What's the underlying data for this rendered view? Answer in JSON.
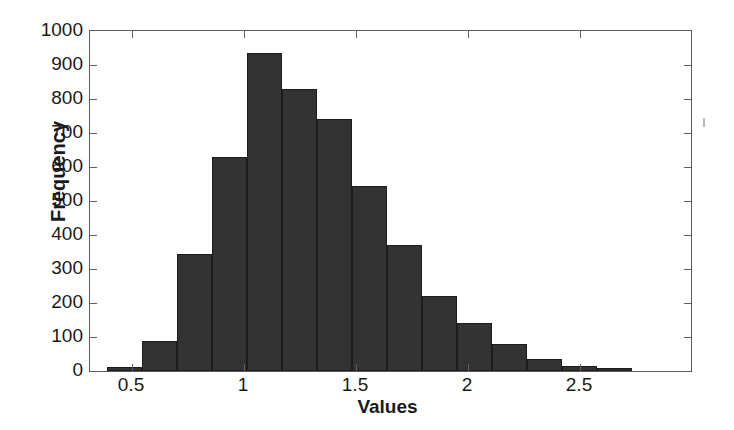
{
  "chart_data": {
    "type": "bar",
    "title": "",
    "subtitle": "",
    "xlabel": "Values",
    "ylabel": "Frequency",
    "xlim": [
      0.3125,
      2.9955
    ],
    "ylim": [
      0,
      1000
    ],
    "grid": false,
    "legend": null,
    "bin_width": 0.15625,
    "bar_color": "#333333",
    "bar_edge_color": "#1c1c1c",
    "axis_color": "#5d5d5d",
    "x_ticks": [
      0.5,
      1,
      1.5,
      2,
      2.5
    ],
    "x_tick_labels": [
      "0.5",
      "1",
      "1.5",
      "2",
      "2.5"
    ],
    "y_ticks": [
      0,
      100,
      200,
      300,
      400,
      500,
      600,
      700,
      800,
      900,
      1000
    ],
    "y_tick_labels": [
      "0",
      "100",
      "200",
      "300",
      "400",
      "500",
      "600",
      "700",
      "800",
      "900",
      "1000"
    ],
    "bin_edges": [
      0.3875,
      0.5438,
      0.7,
      0.8563,
      1.0125,
      1.1688,
      1.325,
      1.4813,
      1.6375,
      1.7938,
      1.95,
      2.1063,
      2.2625,
      2.4188,
      2.575,
      2.7313
    ],
    "bin_centers": [
      0.4656,
      0.6219,
      0.7781,
      0.9344,
      1.0906,
      1.2469,
      1.4031,
      1.5594,
      1.7156,
      1.8719,
      2.0281,
      2.1844,
      2.3406,
      2.4969,
      2.6531
    ],
    "values": [
      12,
      88,
      345,
      630,
      935,
      830,
      740,
      543,
      372,
      222,
      142,
      78,
      35,
      15,
      8
    ],
    "annotations": []
  }
}
